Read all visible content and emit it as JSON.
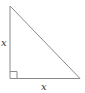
{
  "diagram": {
    "type": "right-triangle",
    "labels": {
      "left_leg": "x",
      "bottom_leg": "x"
    },
    "right_angle_marker": true,
    "stroke_color": "#888888",
    "label_color": "#333333"
  }
}
